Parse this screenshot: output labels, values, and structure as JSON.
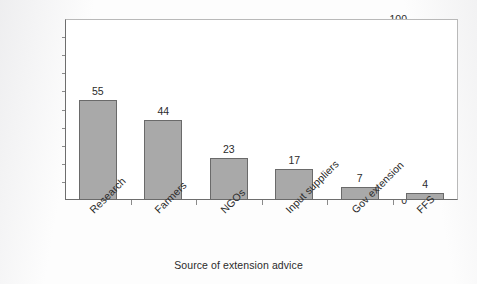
{
  "chart_data": {
    "type": "bar",
    "title": "",
    "categories": [
      "Research",
      "Farmers",
      "NGOs",
      "Input suppliers",
      "Gov extension",
      "FFS"
    ],
    "values": [
      55,
      44,
      23,
      17,
      7,
      4
    ],
    "value_labels": [
      "55",
      "44",
      "23",
      "17",
      "7",
      "4"
    ],
    "xlabel": "Source of extension advice",
    "ylabel": "Percentage (%)",
    "ylim": [
      0,
      100
    ],
    "ytick_labels": [
      "0",
      "10",
      "20",
      "30",
      "40",
      "50",
      "60",
      "70",
      "80",
      "90",
      "100"
    ],
    "ytick_values": [
      0,
      10,
      20,
      30,
      40,
      50,
      60,
      70,
      80,
      90,
      100
    ],
    "grid": false,
    "legend": false,
    "legend_position": "none",
    "bar_color": "#a9a9a9",
    "bar_border_color": "#6a6a6a",
    "axis_color": "#6e6e6e",
    "plot_background": "#ffffff",
    "xtick_label_rotation": -45
  }
}
